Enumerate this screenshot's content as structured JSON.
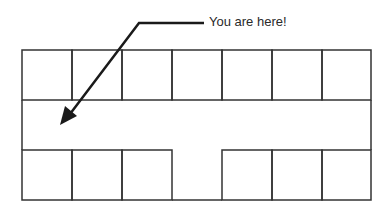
{
  "diagram": {
    "type": "floor-plan",
    "annotation": "You are here!",
    "layout": {
      "top_row_rooms": 7,
      "bottom_row_rooms_left": 3,
      "bottom_row_rooms_right": 3,
      "corridor": "horizontal hallway between rows with opening at bottom center"
    },
    "colors": {
      "line": "#333333",
      "arrow": "#1a1a1a",
      "background": "#ffffff"
    }
  }
}
